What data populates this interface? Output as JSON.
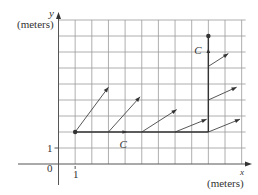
{
  "figure": {
    "axes": {
      "x_label": "x",
      "x_unit_label": "(meters)",
      "y_label": "y",
      "y_unit_label": "(meters)",
      "origin_label": "0",
      "x_tick_label": "1",
      "y_tick_label": "1"
    },
    "grid": {
      "x_min": 0,
      "x_max": 11,
      "y_min": 0,
      "y_max": 9,
      "color": "#9a9a9a"
    },
    "curve": {
      "label": "C",
      "color": "#333333",
      "start_point": [
        1,
        2
      ],
      "segments": [
        {
          "from": [
            1,
            2
          ],
          "to": [
            9,
            2
          ]
        },
        {
          "from": [
            9,
            2
          ],
          "to": [
            9,
            8
          ]
        }
      ],
      "end_point": [
        9,
        8
      ],
      "direction_arrows": [
        {
          "at": [
            4,
            2
          ],
          "dir": "right",
          "label_pos": [
            3.9,
            1.25
          ]
        },
        {
          "at": [
            9,
            7.1
          ],
          "dir": "up",
          "label_pos": [
            8.4,
            7.1
          ]
        }
      ]
    },
    "vector_field_arrows": [
      {
        "from": [
          1,
          2
        ],
        "to": [
          3,
          4.8
        ]
      },
      {
        "from": [
          3,
          2
        ],
        "to": [
          4.9,
          4.2
        ]
      },
      {
        "from": [
          5,
          2
        ],
        "to": [
          7.1,
          3.4
        ]
      },
      {
        "from": [
          7,
          2
        ],
        "to": [
          8.9,
          2.8
        ]
      },
      {
        "from": [
          9,
          2
        ],
        "to": [
          10.9,
          2.8
        ]
      },
      {
        "from": [
          9,
          4
        ],
        "to": [
          10.7,
          4.8
        ]
      },
      {
        "from": [
          9,
          6.1
        ],
        "to": [
          10.2,
          6.9
        ]
      }
    ]
  }
}
